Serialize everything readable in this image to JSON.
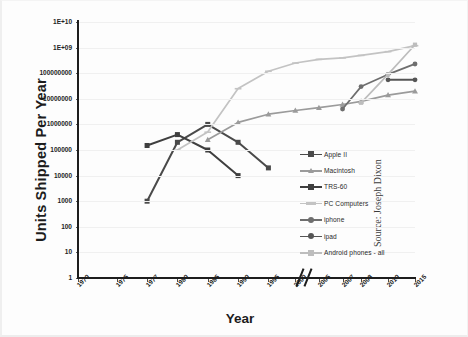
{
  "figure": {
    "source_note": "Source: Joseph Dixon",
    "background": "#fdfdfd"
  },
  "chart_data": {
    "type": "line",
    "title": "",
    "subtitle": "",
    "xlabel": "Year",
    "ylabel": "Units Shipped Per Year",
    "grid": true,
    "legend_position": "center-right",
    "yscale": "log",
    "ylim": [
      1,
      10000000000
    ],
    "ytick_labels": [
      "1E+10",
      "1E+09",
      "100000000",
      "10000000",
      "1000000",
      "100000",
      "10000",
      "1000",
      "100",
      "10",
      "1"
    ],
    "ytick_values": [
      10000000000,
      1000000000,
      100000000,
      10000000,
      1000000,
      100000,
      10000,
      1000,
      100,
      10,
      1
    ],
    "xtick_labels": [
      "1970",
      "1975",
      "1977",
      "1980",
      "1985",
      "1990",
      "1995",
      "2000",
      "2005",
      "2007",
      "2008",
      "2010",
      "2015"
    ],
    "axis_break": {
      "between": [
        "2005",
        "2007"
      ],
      "label": "//"
    },
    "series": [
      {
        "name": "Apple II",
        "color": "#4a4a4a",
        "marker": "square",
        "points": [
          {
            "x": "1977",
            "y": 1000
          },
          {
            "x": "1980",
            "y": 200000
          },
          {
            "x": "1985",
            "y": 1000000
          },
          {
            "x": "1990",
            "y": 200000
          },
          {
            "x": "1995",
            "y": 20000
          }
        ]
      },
      {
        "name": "Macintosh",
        "color": "#9b9b9b",
        "marker": "triangle",
        "points": [
          {
            "x": "1985",
            "y": 250000
          },
          {
            "x": "1990",
            "y": 1200000
          },
          {
            "x": "1995",
            "y": 2500000
          },
          {
            "x": "2000",
            "y": 3500000
          },
          {
            "x": "2005",
            "y": 4500000
          },
          {
            "x": "2007",
            "y": 6000000
          },
          {
            "x": "2008",
            "y": 8000000
          },
          {
            "x": "2010",
            "y": 14000000
          },
          {
            "x": "2015",
            "y": 20000000
          }
        ]
      },
      {
        "name": "TRS-60",
        "color": "#3f3f3f",
        "marker": "square",
        "points": [
          {
            "x": "1977",
            "y": 150000
          },
          {
            "x": "1980",
            "y": 400000
          },
          {
            "x": "1985",
            "y": 100000
          },
          {
            "x": "1990",
            "y": 10000
          }
        ]
      },
      {
        "name": "PC Computers",
        "color": "#c3c3c3",
        "marker": "dash",
        "points": [
          {
            "x": "1980",
            "y": 100000
          },
          {
            "x": "1985",
            "y": 500000
          },
          {
            "x": "1990",
            "y": 25000000
          },
          {
            "x": "1995",
            "y": 120000000
          },
          {
            "x": "2000",
            "y": 250000000
          },
          {
            "x": "2005",
            "y": 350000000
          },
          {
            "x": "2007",
            "y": 400000000
          },
          {
            "x": "2008",
            "y": 500000000
          },
          {
            "x": "2010",
            "y": 700000000
          },
          {
            "x": "2015",
            "y": 1200000000
          }
        ]
      },
      {
        "name": "iphone",
        "color": "#6e6e6e",
        "marker": "circle",
        "points": [
          {
            "x": "2007",
            "y": 4000000
          },
          {
            "x": "2008",
            "y": 30000000
          },
          {
            "x": "2010",
            "y": 90000000
          },
          {
            "x": "2015",
            "y": 230000000
          }
        ]
      },
      {
        "name": "ipad",
        "color": "#555555",
        "marker": "circle",
        "points": [
          {
            "x": "2010",
            "y": 55000000
          },
          {
            "x": "2015",
            "y": 55000000
          }
        ]
      },
      {
        "name": "Android phones - all",
        "color": "#bdbdbd",
        "marker": "square",
        "points": [
          {
            "x": "2008",
            "y": 7000000
          },
          {
            "x": "2010",
            "y": 90000000
          },
          {
            "x": "2015",
            "y": 1300000000
          }
        ]
      }
    ]
  }
}
